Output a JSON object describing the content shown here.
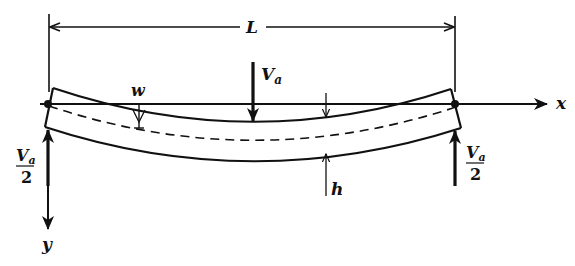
{
  "figure": {
    "type": "simply-supported beam under central point load",
    "colors": {
      "ink": "#111111",
      "background": "#ffffff"
    }
  },
  "labels": {
    "span": "L",
    "load": "V",
    "load_sub": "a",
    "deflection": "w",
    "thickness": "h",
    "x_axis": "x",
    "y_axis": "y",
    "reaction_left_num": "V",
    "reaction_left_sub": "a",
    "reaction_left_den": "2",
    "reaction_right_num": "V",
    "reaction_right_sub": "a",
    "reaction_right_den": "2"
  }
}
